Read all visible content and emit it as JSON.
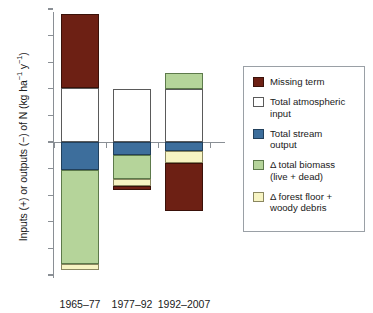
{
  "chart_data": {
    "type": "bar",
    "subtype": "stacked-diverging",
    "title": "",
    "xlabel": "",
    "ylabel": "Inputs (+) or outputs (−) of N (kg ha⁻¹ y⁻¹)",
    "ylim": [
      -25,
      25
    ],
    "ytick_values": [
      25,
      20,
      15,
      10,
      5,
      0,
      -5,
      -10,
      -15,
      -20,
      -25
    ],
    "ytick_labels": [
      "25",
      "20",
      "15",
      "10",
      "5",
      "0",
      "−5",
      "−10",
      "−15",
      "−20",
      "−25"
    ],
    "grid": false,
    "legend_position": "right",
    "categories": [
      "1965–77",
      "1977–92",
      "1992–2007"
    ],
    "series": [
      {
        "name": "Missing term",
        "key": "missing",
        "color": "#6d2014",
        "segments": [
          {
            "category": "1965–77",
            "from": 10.2,
            "to": 24.0,
            "value": 13.8
          },
          {
            "category": "1977–92",
            "from": -8.2,
            "to": -9.0,
            "value": -0.8
          },
          {
            "category": "1992–2007",
            "from": -4.0,
            "to": -13.0,
            "value": -9.0
          }
        ]
      },
      {
        "name": "Total atmospheric input",
        "key": "atmos",
        "color": "#ffffff",
        "segments": [
          {
            "category": "1965–77",
            "from": 0.0,
            "to": 10.2,
            "value": 10.2
          },
          {
            "category": "1977–92",
            "from": 0.0,
            "to": 10.0,
            "value": 10.0
          },
          {
            "category": "1992–2007",
            "from": 0.0,
            "to": 10.0,
            "value": 10.0
          }
        ]
      },
      {
        "name": "Total stream output",
        "key": "stream",
        "color": "#3d6e9c",
        "segments": [
          {
            "category": "1965–77",
            "from": 0.0,
            "to": -5.2,
            "value": -5.2
          },
          {
            "category": "1977–92",
            "from": 0.0,
            "to": -2.5,
            "value": -2.5
          },
          {
            "category": "1992–2007",
            "from": 0.0,
            "to": -1.7,
            "value": -1.7
          }
        ]
      },
      {
        "name": "Δ total biomass (live + dead)",
        "key": "biomass",
        "color": "#b5d49a",
        "segments": [
          {
            "category": "1965–77",
            "from": -5.2,
            "to": -23.0,
            "value": -17.8
          },
          {
            "category": "1977–92",
            "from": -2.5,
            "to": -7.0,
            "value": -4.5
          },
          {
            "category": "1992–2007",
            "from": 10.0,
            "to": 13.0,
            "value": 3.0
          }
        ]
      },
      {
        "name": "Δ forest floor + woody debris",
        "key": "floor",
        "color": "#f7f4c3",
        "segments": [
          {
            "category": "1965–77",
            "from": -23.0,
            "to": -24.0,
            "value": -1.0
          },
          {
            "category": "1977–92",
            "from": -7.0,
            "to": -8.2,
            "value": -1.2
          },
          {
            "category": "1992–2007",
            "from": -1.7,
            "to": -4.0,
            "value": -2.3
          }
        ]
      }
    ]
  },
  "axis": {
    "ylabel_pre": "Inputs (+) or outputs (−) of N (kg ha",
    "ylabel_sup1": "−1",
    "ylabel_mid": " y",
    "ylabel_sup2": "−1",
    "ylabel_post": ")",
    "ticks": [
      {
        "label": "25",
        "value": 25
      },
      {
        "label": "20",
        "value": 20
      },
      {
        "label": "15",
        "value": 15
      },
      {
        "label": "10",
        "value": 10
      },
      {
        "label": "5",
        "value": 5
      },
      {
        "label": "0",
        "value": 0
      },
      {
        "label": "−5",
        "value": -5
      },
      {
        "label": "−10",
        "value": -10
      },
      {
        "label": "−15",
        "value": -15
      },
      {
        "label": "−20",
        "value": -20
      },
      {
        "label": "−25",
        "value": -25
      }
    ]
  },
  "xaxis": {
    "categories": [
      {
        "label": "1965–77"
      },
      {
        "label": "1977–92"
      },
      {
        "label": "1992–2007"
      }
    ]
  },
  "legend": {
    "items": [
      {
        "key": "missing",
        "label": "Missing term"
      },
      {
        "key": "atmos",
        "label": "Total atmospheric\ninput"
      },
      {
        "key": "stream",
        "label": "Total stream\noutput"
      },
      {
        "key": "biomass",
        "label": "Δ total biomass\n(live + dead)"
      },
      {
        "key": "floor",
        "label": "Δ forest floor +\nwoody debris"
      }
    ]
  }
}
